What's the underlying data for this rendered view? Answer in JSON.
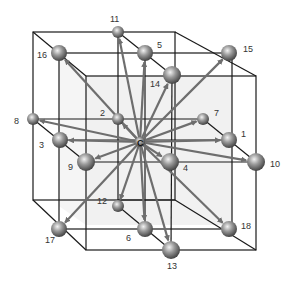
{
  "diagram": {
    "center_label": "C",
    "colors": {
      "edge": "#1a1a1a",
      "arrow": "#6e6e6e",
      "sphere_light": "#d9d9d9",
      "sphere_dark": "#555555",
      "shade": "#f0f0f0"
    },
    "center": [
      140,
      142
    ],
    "nodes": [
      {
        "id": "1",
        "x": 229,
        "y": 140,
        "lx": 241,
        "ly": 137,
        "r": 8
      },
      {
        "id": "2",
        "x": 118,
        "y": 119,
        "lx": 100,
        "ly": 116,
        "r": 6
      },
      {
        "id": "3",
        "x": 60,
        "y": 140,
        "lx": 39,
        "ly": 148,
        "r": 8
      },
      {
        "id": "4",
        "x": 170,
        "y": 162,
        "lx": 183,
        "ly": 171,
        "r": 9
      },
      {
        "id": "5",
        "x": 145,
        "y": 53,
        "lx": 157,
        "ly": 48,
        "r": 8
      },
      {
        "id": "6",
        "x": 145,
        "y": 229,
        "lx": 126,
        "ly": 241,
        "r": 8
      },
      {
        "id": "7",
        "x": 203,
        "y": 119,
        "lx": 214,
        "ly": 116,
        "r": 6
      },
      {
        "id": "8",
        "x": 33,
        "y": 119,
        "lx": 14,
        "ly": 124,
        "r": 6
      },
      {
        "id": "9",
        "x": 86,
        "y": 162,
        "lx": 68,
        "ly": 170,
        "r": 9
      },
      {
        "id": "10",
        "x": 256,
        "y": 162,
        "lx": 270,
        "ly": 167,
        "r": 9
      },
      {
        "id": "11",
        "x": 118,
        "y": 32,
        "lx": 110,
        "ly": 22,
        "r": 6
      },
      {
        "id": "12",
        "x": 118,
        "y": 206,
        "lx": 97,
        "ly": 204,
        "r": 6
      },
      {
        "id": "13",
        "x": 171,
        "y": 250,
        "lx": 167,
        "ly": 269,
        "r": 9
      },
      {
        "id": "14",
        "x": 172,
        "y": 75,
        "lx": 150,
        "ly": 87,
        "r": 9
      },
      {
        "id": "15",
        "x": 229,
        "y": 53,
        "lx": 243,
        "ly": 52,
        "r": 8
      },
      {
        "id": "16",
        "x": 59,
        "y": 53,
        "lx": 37,
        "ly": 58,
        "r": 8
      },
      {
        "id": "17",
        "x": 59,
        "y": 229,
        "lx": 45,
        "ly": 243,
        "r": 8
      },
      {
        "id": "18",
        "x": 229,
        "y": 229,
        "lx": 241,
        "ly": 229,
        "r": 8
      }
    ]
  }
}
